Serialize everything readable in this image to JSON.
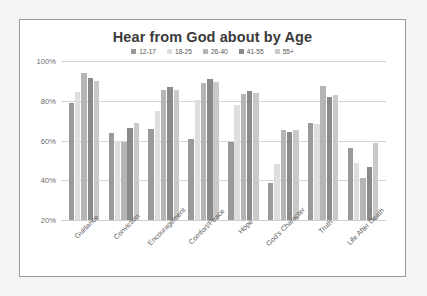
{
  "chart_data": {
    "type": "bar",
    "title": "Hear from God about by Age",
    "xlabel": "",
    "ylabel": "",
    "ylim": [
      20,
      100
    ],
    "ytick_labels": [
      "100%",
      "80%",
      "60%",
      "40%",
      "20%"
    ],
    "ytick_values": [
      100,
      80,
      60,
      40,
      20
    ],
    "grid": true,
    "legend_position": "top-center",
    "categories": [
      "Guidance",
      "Conviction",
      "Encouragement",
      "Comfort/Peace",
      "Hope",
      "God's Character",
      "Truth",
      "Life After Death"
    ],
    "series": [
      {
        "name": "12-17",
        "color": "#9a9a9a",
        "values": [
          79,
          64,
          66,
          61,
          59.5,
          38.5,
          69,
          56
        ]
      },
      {
        "name": "18-25",
        "color": "#dedede",
        "values": [
          84.5,
          60,
          75,
          80.5,
          78,
          48,
          68.5,
          48.5
        ]
      },
      {
        "name": "26-40",
        "color": "#b5b5b5",
        "values": [
          94,
          59.5,
          85.5,
          89,
          83.5,
          65.5,
          87.5,
          41
        ]
      },
      {
        "name": "41-55",
        "color": "#8a8a8a",
        "values": [
          91.5,
          66.5,
          87,
          91,
          85,
          64.5,
          82,
          46.5
        ]
      },
      {
        "name": "55+",
        "color": "#c9c9c9",
        "values": [
          90,
          69,
          85.5,
          89.5,
          84,
          65.5,
          83,
          59
        ]
      }
    ]
  },
  "legend": {
    "items": [
      {
        "label": "12-17",
        "color": "#9a9a9a"
      },
      {
        "label": "18-25",
        "color": "#dedede"
      },
      {
        "label": "26-40",
        "color": "#b5b5b5"
      },
      {
        "label": "41-55",
        "color": "#8a8a8a"
      },
      {
        "label": "55+",
        "color": "#c9c9c9"
      }
    ]
  },
  "style": {
    "card_background": "#ffffff",
    "card_border": "#9a9a9a",
    "page_background": "#f4f4f2",
    "gridline_color": "#d4d4d4",
    "title_color": "#3b3b3b",
    "tick_color": "#6a6a6a"
  }
}
